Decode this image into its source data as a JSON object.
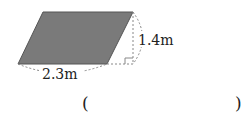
{
  "figure": {
    "shape": "parallelogram",
    "fill_color": "#7a7a7a",
    "base_label": "2.3m",
    "height_label": "1.4m"
  },
  "answer": {
    "open_paren": "(",
    "close_paren": ")",
    "value": ""
  }
}
